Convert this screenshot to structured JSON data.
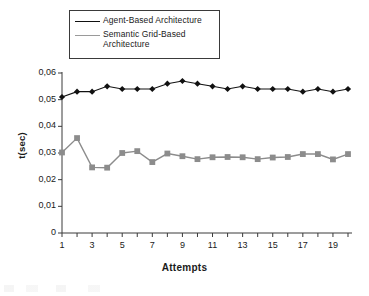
{
  "chart_data": {
    "type": "line",
    "title": "",
    "xlabel": "Attempts",
    "ylabel": "t(sec)",
    "x": [
      1,
      2,
      3,
      4,
      5,
      6,
      7,
      8,
      9,
      10,
      11,
      12,
      13,
      14,
      15,
      16,
      17,
      18,
      19,
      20
    ],
    "xlim": [
      1,
      20
    ],
    "ylim": [
      0,
      0.06
    ],
    "ytick_labels": [
      "0,06",
      "0,05",
      "0,04",
      "0,03",
      "0,02",
      "0,01",
      "0"
    ],
    "ytick_values": [
      0.06,
      0.05,
      0.04,
      0.03,
      0.02,
      0.01,
      0
    ],
    "xtick_labels": [
      "1",
      "3",
      "5",
      "7",
      "9",
      "11",
      "13",
      "15",
      "17",
      "19"
    ],
    "xtick_values": [
      1,
      3,
      5,
      7,
      9,
      11,
      13,
      15,
      17,
      19
    ],
    "grid": false,
    "legend_position": "top-left",
    "decimal_separator": ",",
    "series": [
      {
        "name": "Agent-Based Architecture",
        "marker": "diamond",
        "color": "#111111",
        "values": [
          0.051,
          0.053,
          0.053,
          0.055,
          0.054,
          0.054,
          0.054,
          0.056,
          0.057,
          0.056,
          0.055,
          0.054,
          0.055,
          0.054,
          0.054,
          0.054,
          0.053,
          0.054,
          0.053,
          0.054
        ]
      },
      {
        "name": "Semantic Grid-Based Architecture",
        "marker": "square",
        "color": "#8c8c8c",
        "values": [
          0.0302,
          0.0356,
          0.0246,
          0.0245,
          0.03,
          0.0307,
          0.0266,
          0.0298,
          0.0288,
          0.0277,
          0.0284,
          0.0285,
          0.0284,
          0.0277,
          0.0283,
          0.0285,
          0.0296,
          0.0296,
          0.0276,
          0.0296
        ]
      }
    ]
  },
  "legend": {
    "items": [
      {
        "label_line1": "Agent-Based Architecture",
        "label_line2": ""
      },
      {
        "label_line1": "Semantic Grid-Based",
        "label_line2": "Architecture"
      }
    ]
  },
  "axes": {
    "x_title": "Attempts",
    "y_title": "t(sec)"
  }
}
